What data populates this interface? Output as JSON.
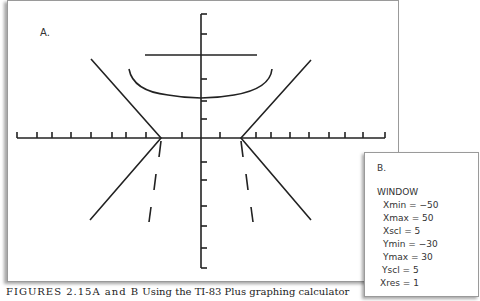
{
  "panel_a": {
    "label": "A.",
    "graph": {
      "x_axis_ticks": 19,
      "y_axis_ticks": 12,
      "shapes": [
        "horizontal-line",
        "parabola-arc",
        "v-shape-left",
        "v-shape-right",
        "dashed-segments"
      ]
    }
  },
  "panel_b": {
    "label": "B.",
    "title": "WINDOW",
    "settings": [
      {
        "text": "Xmin = −50"
      },
      {
        "text": "Xmax = 50"
      },
      {
        "text": "Xscl = 5"
      },
      {
        "text": "Ymin = −30"
      },
      {
        "text": "Ymax = 30"
      },
      {
        "text": "Yscl = 5"
      },
      {
        "text": "Xres = 1"
      }
    ]
  },
  "caption": {
    "figure": "FIGURES 2.15A and B",
    "text": "Using the TI-83 Plus graphing calculator"
  }
}
